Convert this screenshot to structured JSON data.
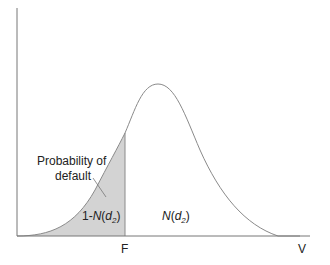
{
  "diagram": {
    "title": "",
    "type": "normal distribution of asset value with default threshold",
    "x_axis_label": "V",
    "threshold_label": "F",
    "annotation": {
      "line1": "Probability of",
      "line2": "default"
    },
    "region_left_label": {
      "prefix": "1-",
      "func": "N",
      "arg": "d",
      "sub": "2"
    },
    "region_right_label": {
      "func": "N",
      "arg": "d",
      "sub": "2"
    },
    "colors": {
      "curve": "#8a8a8a",
      "shaded": "#d3d3d3",
      "axis": "#777777",
      "text": "#222222"
    }
  }
}
